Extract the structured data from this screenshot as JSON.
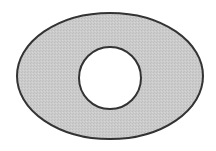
{
  "diagram": {
    "colors": {
      "background": "#ffffff",
      "fill": "#c8c8c8",
      "stroke": "#333333",
      "hole": "#ffffff"
    },
    "outer_ellipse": {
      "cx": 110,
      "cy": 76,
      "rx": 93,
      "ry": 63
    },
    "inner_circle": {
      "cx": 110,
      "cy": 78,
      "r": 31
    }
  }
}
